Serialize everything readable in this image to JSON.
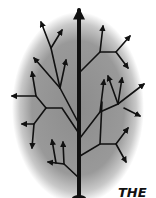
{
  "diagram": {
    "type": "tree-of-arrows",
    "background": {
      "shape": "oval",
      "center_color": "#8f8f8f",
      "edge_color": "#ffffff"
    },
    "line_color": "#111111",
    "trunk": {
      "x": 78,
      "top": 6,
      "bottom": 198
    },
    "caption": "THE"
  }
}
